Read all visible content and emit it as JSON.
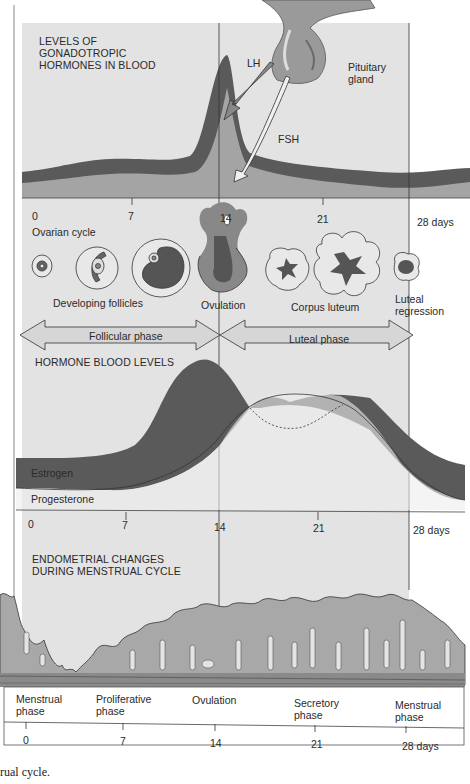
{
  "colors": {
    "panel_bg": "#e3e3e3",
    "dark_band": "#5a5a5a",
    "mid_fill": "#a4a4a4",
    "light_region": "#ececec",
    "tissue": "#a8a8a8",
    "outline": "#333333",
    "white_bg": "#ffffff"
  },
  "gonadotropic": {
    "title": "LEVELS OF\nGONADOTROPIC\nHORMONES IN BLOOD",
    "lh_label": "LH",
    "fsh_label": "FSH",
    "pituitary_label": "Pituitary\ngland"
  },
  "axis_top": {
    "ticks": [
      "0",
      "7",
      "14",
      "21",
      "28 days"
    ]
  },
  "ovarian": {
    "title": "Ovarian cycle",
    "labels": {
      "developing": "Developing follicles",
      "ovulation": "Ovulation",
      "corpus": "Corpus luteum",
      "regression": "Luteal\nregression"
    },
    "phases": {
      "follicular": "Follicular phase",
      "luteal": "Luteal phase"
    }
  },
  "hormones": {
    "title": "HORMONE BLOOD LEVELS",
    "estrogen": "Estrogen",
    "progesterone": "Progesterone"
  },
  "axis_mid": {
    "ticks": [
      "0",
      "7",
      "14",
      "21",
      "28 days"
    ]
  },
  "endometrial": {
    "title": "ENDOMETRIAL CHANGES\nDURING MENSTRUAL CYCLE",
    "phases": [
      "Menstrual\nphase",
      "Proliferative\nphase",
      "Ovulation",
      "Secretory\nphase",
      "Menstrual\nphase"
    ]
  },
  "axis_bottom": {
    "ticks": [
      "0",
      "7",
      "14",
      "21",
      "28 days"
    ]
  },
  "caption": "rual cycle."
}
